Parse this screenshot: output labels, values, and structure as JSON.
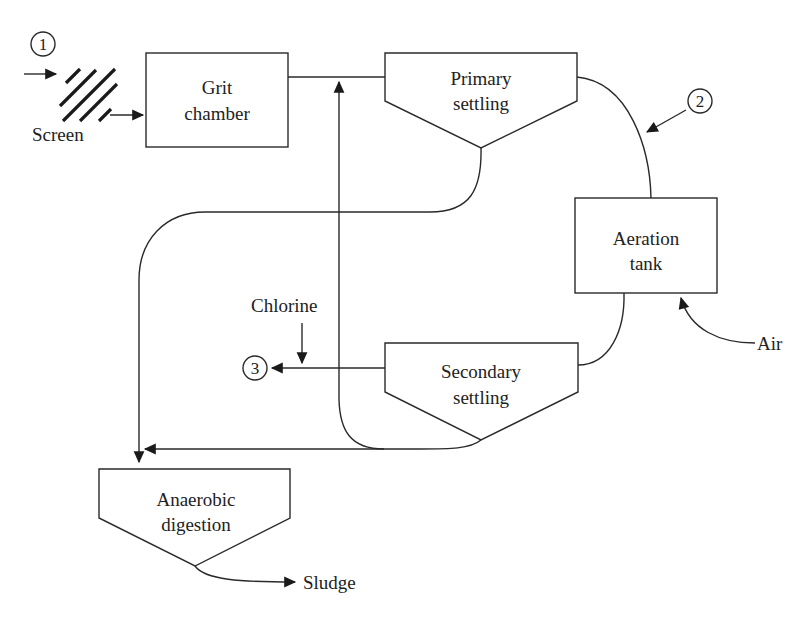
{
  "diagram": {
    "type": "process-flow",
    "units": [
      {
        "id": "screen",
        "label": "Screen"
      },
      {
        "id": "grit",
        "label_line1": "Grit",
        "label_line2": "chamber"
      },
      {
        "id": "primary",
        "label_line1": "Primary",
        "label_line2": "settling"
      },
      {
        "id": "aeration",
        "label_line1": "Aeration",
        "label_line2": "tank"
      },
      {
        "id": "secondary",
        "label_line1": "Secondary",
        "label_line2": "settling"
      },
      {
        "id": "digestion",
        "label_line1": "Anaerobic",
        "label_line2": "digestion"
      }
    ],
    "inputs": {
      "chlorine": "Chlorine",
      "air": "Air"
    },
    "outputs": {
      "sludge": "Sludge"
    },
    "markers": [
      "1",
      "2",
      "3"
    ],
    "edges": [
      {
        "from": "influent (1)",
        "to": "screen"
      },
      {
        "from": "screen",
        "to": "grit"
      },
      {
        "from": "grit",
        "to": "primary"
      },
      {
        "from": "primary",
        "to": "aeration",
        "marker": "2"
      },
      {
        "from": "aeration",
        "to": "secondary"
      },
      {
        "from": "secondary",
        "to": "effluent (3)",
        "added": "Chlorine"
      },
      {
        "from": "air",
        "to": "aeration"
      },
      {
        "from": "primary",
        "to": "digestion"
      },
      {
        "from": "secondary",
        "to": "digestion"
      },
      {
        "from": "secondary",
        "to": "primary inlet",
        "label": "recycle"
      },
      {
        "from": "digestion",
        "to": "sludge"
      }
    ]
  }
}
